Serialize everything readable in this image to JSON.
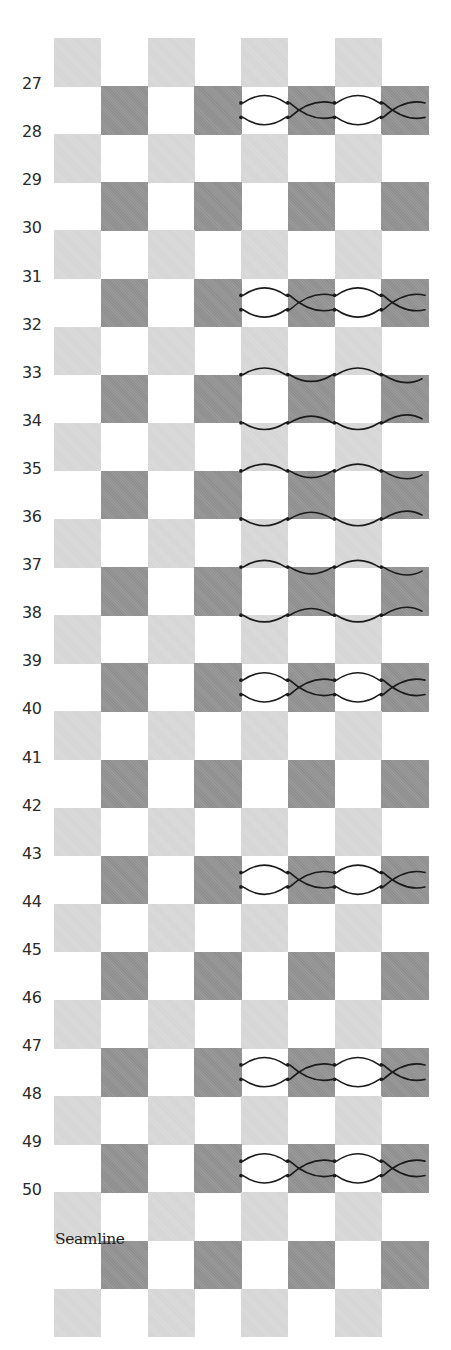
{
  "diagram": {
    "type": "checkerboard-seam-chart",
    "header_text_cut": "",
    "grid": {
      "left": 54,
      "top": 38,
      "cell_width": 46.75,
      "row_height": 48.1,
      "columns": 8,
      "rows": 27,
      "light_color": "#dadada",
      "dark_color": "#959595",
      "light_rows_note": "even rows: light squares in columns 0,2,4,6",
      "dark_rows_note": "odd rows: dark squares in columns 1,3,5,7"
    },
    "row_labels": [
      "27",
      "28",
      "29",
      "30",
      "31",
      "32",
      "33",
      "34",
      "35",
      "36",
      "37",
      "38",
      "39",
      "40",
      "41",
      "42",
      "43",
      "44",
      "45",
      "46",
      "47",
      "48",
      "49",
      "50"
    ],
    "seamline": {
      "label": "Seamline",
      "row": 25
    },
    "stitch_rows": [
      {
        "row": 1,
        "pattern": "x-cross",
        "labels": [
          "27",
          "28"
        ]
      },
      {
        "row": 3,
        "pattern": "none",
        "labels": [
          "29",
          "30"
        ]
      },
      {
        "row": 5,
        "pattern": "x-cross",
        "labels": [
          "31",
          "32"
        ]
      },
      {
        "row": 7,
        "pattern": "wave",
        "labels": [
          "33",
          "34"
        ]
      },
      {
        "row": 9,
        "pattern": "wave",
        "labels": [
          "35",
          "36"
        ]
      },
      {
        "row": 11,
        "pattern": "wave",
        "labels": [
          "37",
          "38"
        ]
      },
      {
        "row": 13,
        "pattern": "x-cross",
        "labels": [
          "39",
          "40"
        ]
      },
      {
        "row": 15,
        "pattern": "none",
        "labels": [
          "41",
          "42"
        ]
      },
      {
        "row": 17,
        "pattern": "x-cross",
        "labels": [
          "43",
          "44"
        ]
      },
      {
        "row": 19,
        "pattern": "none",
        "labels": [
          "45",
          "46"
        ]
      },
      {
        "row": 21,
        "pattern": "x-cross",
        "labels": [
          "47",
          "48"
        ]
      },
      {
        "row": 23,
        "pattern": "x-cross",
        "labels": [
          "49",
          "50"
        ]
      },
      {
        "row": 25,
        "pattern": "none",
        "labels": []
      }
    ],
    "stitch_columns_start": 4,
    "stroke_color": "#1a1a1a"
  }
}
